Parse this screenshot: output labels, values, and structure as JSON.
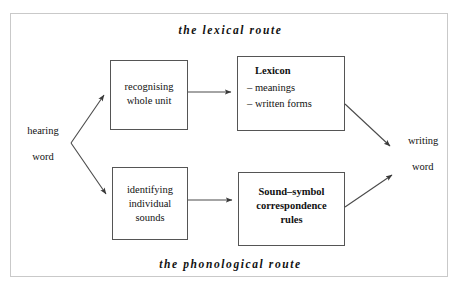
{
  "diagram": {
    "captions": {
      "top": "the lexical route",
      "bottom": "the phonological route"
    },
    "input": {
      "line1": "hearing",
      "line2": "word"
    },
    "output": {
      "line1": "writing",
      "line2": "word"
    },
    "boxes": {
      "recognising": {
        "line1": "recognising",
        "line2": "whole unit"
      },
      "lexicon": {
        "title": "Lexicon",
        "item1": "– meanings",
        "item2": "– written forms"
      },
      "identifying": {
        "line1": "identifying",
        "line2": "individual",
        "line3": "sounds"
      },
      "rules": {
        "line1": "Sound–symbol",
        "line2": "correspondence",
        "line3": "rules"
      }
    },
    "colors": {
      "frame": "#c9c9c9",
      "box_stroke": "#555555",
      "arrow": "#444444",
      "text": "#111111"
    }
  }
}
